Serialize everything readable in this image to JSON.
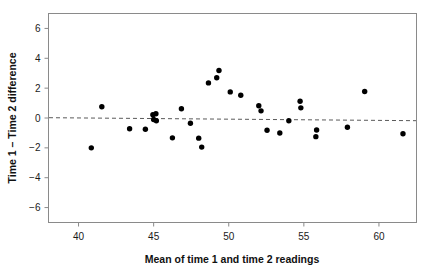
{
  "chart_data": {
    "type": "scatter",
    "title": "",
    "subtitle": "",
    "xlabel": "Mean of time 1 and time 2 readings",
    "ylabel": "Time 1 – Time 2 difference",
    "xlim": [
      38.0,
      62.5
    ],
    "ylim": [
      -7.0,
      7.0
    ],
    "xticks": [
      40,
      45,
      50,
      55,
      60
    ],
    "xtick_labels": [
      "40",
      "45",
      "50",
      "55",
      "60"
    ],
    "yticks": [
      6,
      4,
      2,
      0,
      -2,
      -4,
      -6
    ],
    "ytick_labels": [
      "6",
      "4",
      "2",
      "0",
      "−2",
      "−4",
      "−6"
    ],
    "grid": false,
    "legend": null,
    "marker": "filled-circle",
    "marker_color": "#000000",
    "marker_size": 5.4,
    "reference_line": {
      "name": "mean-difference-line",
      "style": "dashed",
      "color": "#5a5a5a",
      "y_at_xmin": 0.02,
      "y_at_xmax": -0.18
    },
    "n_points": 37,
    "points": [
      {
        "x": 40.85,
        "y": -2.0
      },
      {
        "x": 41.55,
        "y": 0.75
      },
      {
        "x": 43.4,
        "y": -0.72
      },
      {
        "x": 44.45,
        "y": -0.75
      },
      {
        "x": 44.95,
        "y": 0.22
      },
      {
        "x": 45.15,
        "y": 0.28
      },
      {
        "x": 45.0,
        "y": -0.1
      },
      {
        "x": 45.18,
        "y": -0.18
      },
      {
        "x": 46.25,
        "y": -1.33
      },
      {
        "x": 46.85,
        "y": 0.62
      },
      {
        "x": 47.45,
        "y": -0.35
      },
      {
        "x": 48.0,
        "y": -1.35
      },
      {
        "x": 48.2,
        "y": -1.95
      },
      {
        "x": 48.65,
        "y": 2.35
      },
      {
        "x": 49.2,
        "y": 2.7
      },
      {
        "x": 49.35,
        "y": 3.18
      },
      {
        "x": 50.1,
        "y": 1.75
      },
      {
        "x": 50.8,
        "y": 1.52
      },
      {
        "x": 52.0,
        "y": 0.82
      },
      {
        "x": 52.15,
        "y": 0.48
      },
      {
        "x": 52.55,
        "y": -0.82
      },
      {
        "x": 53.4,
        "y": -1.0
      },
      {
        "x": 54.0,
        "y": -0.18
      },
      {
        "x": 54.75,
        "y": 1.12
      },
      {
        "x": 54.8,
        "y": 0.68
      },
      {
        "x": 55.85,
        "y": -0.8
      },
      {
        "x": 55.8,
        "y": -1.25
      },
      {
        "x": 57.9,
        "y": -0.62
      },
      {
        "x": 59.05,
        "y": 1.78
      },
      {
        "x": 61.6,
        "y": -1.05
      }
    ]
  },
  "figure": {
    "background": "#ffffff",
    "frame_color": "#8a8a8a",
    "text_color": "#111111"
  }
}
